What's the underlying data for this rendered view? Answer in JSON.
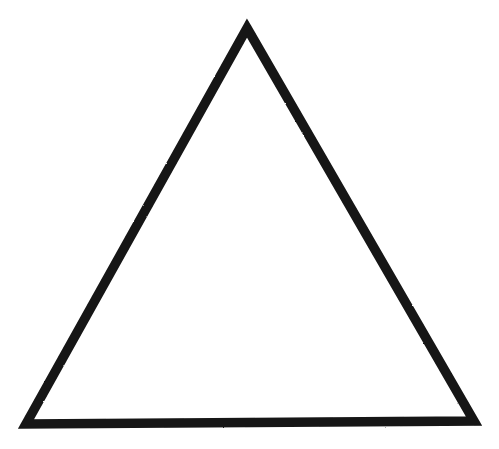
{
  "image": {
    "kind": "line-drawing",
    "subject": "triangle",
    "description": "Black outlined equilateral-like triangle on a plain white background",
    "width": 499,
    "height": 449,
    "background_color": "#ffffff",
    "ink_color": "#151515",
    "filled": false,
    "stroke_width": 9.5,
    "texture": "scanned / photocopied with slightly rough, mottled edges",
    "text_content": "",
    "label_count": 0
  },
  "shape": {
    "name": "triangle",
    "sides": 3,
    "orientation": "apex-up",
    "fill": "none",
    "stroke": "#151515",
    "vertices": [
      {
        "name": "apex",
        "x": 247,
        "y": 28
      },
      {
        "name": "bottom-right",
        "x": 474,
        "y": 421
      },
      {
        "name": "bottom-left",
        "x": 26,
        "y": 424
      }
    ],
    "path": "M 247 28 L 474 421 L 26 424 Z",
    "base_width": 448,
    "height": 395,
    "tilt_note": "base is about 3px lower on the left than on the right"
  }
}
